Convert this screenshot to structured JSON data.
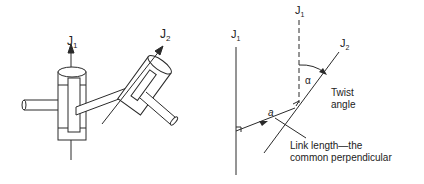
{
  "left_figure": {
    "axis1_label": "J",
    "axis1_sub": "1",
    "axis2_label": "J",
    "axis2_sub": "2"
  },
  "right_figure": {
    "axis1_label": "J",
    "axis1_sub": "1",
    "axis1_dashed_label": "J",
    "axis1_dashed_sub": "1",
    "axis2_label": "J",
    "axis2_sub": "2",
    "alpha_symbol": "α",
    "link_symbol": "a",
    "twist_line1": "Twist",
    "twist_line2": "angle",
    "link_line1": "Link length—the",
    "link_line2": "common perpendicular"
  },
  "colors": {
    "line": "#2a2a2a",
    "background": "#ffffff"
  }
}
